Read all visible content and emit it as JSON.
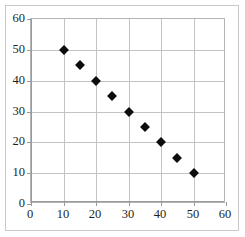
{
  "chart_data": {
    "type": "scatter",
    "title": "",
    "subtitle": "",
    "xlabel": "",
    "ylabel": "",
    "xlim": [
      0,
      60
    ],
    "ylim": [
      0,
      60
    ],
    "xticks": [
      0,
      10,
      20,
      30,
      40,
      50,
      60
    ],
    "yticks": [
      0,
      10,
      20,
      30,
      40,
      50,
      60
    ],
    "xtick_labels": [
      "0",
      "10",
      "20",
      "30",
      "40",
      "50",
      "60"
    ],
    "ytick_labels": [
      "0",
      "10",
      "20",
      "30",
      "40",
      "50",
      "60"
    ],
    "grid": true,
    "legend": false,
    "legend_position": "none",
    "marker_style": "diamond",
    "marker_color": "#0d0d0d",
    "grid_color": "#c3c3c3",
    "axis_color": "#9a9a9a",
    "frame_color": "#c9c9c9",
    "background_color": "#ffffff",
    "series": [
      {
        "name": "series-1",
        "x": [
          10,
          15,
          20,
          25,
          30,
          35,
          40,
          45,
          50
        ],
        "y": [
          50,
          45,
          40,
          35,
          30,
          25,
          20,
          15,
          10
        ],
        "points": [
          {
            "x": 10,
            "y": 50
          },
          {
            "x": 15,
            "y": 45
          },
          {
            "x": 20,
            "y": 40
          },
          {
            "x": 25,
            "y": 35
          },
          {
            "x": 30,
            "y": 30
          },
          {
            "x": 35,
            "y": 25
          },
          {
            "x": 40,
            "y": 20
          },
          {
            "x": 45,
            "y": 15
          },
          {
            "x": 50,
            "y": 10
          }
        ]
      }
    ]
  }
}
